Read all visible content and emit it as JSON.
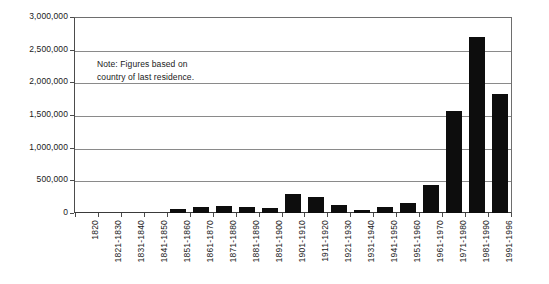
{
  "chart_data": {
    "type": "bar",
    "title": "",
    "xlabel": "",
    "ylabel": "",
    "categories": [
      "1820",
      "1821-1830",
      "1831-1840",
      "1841-1850",
      "1851-1860",
      "1861-1870",
      "1871-1880",
      "1881-1890",
      "1891-1900",
      "1901-1910",
      "1911-1920",
      "1921-1930",
      "1931-1940",
      "1941-1950",
      "1951-1960",
      "1961-1970",
      "1971-1980",
      "1981-1990",
      "1991-1996"
    ],
    "values": [
      0,
      0,
      0,
      0,
      60000,
      85000,
      105000,
      95000,
      80000,
      295000,
      240000,
      125000,
      40000,
      95000,
      150000,
      430000,
      1570000,
      2710000,
      1830000
    ],
    "ylim": [
      0,
      3000000
    ],
    "ytick_values": [
      0,
      500000,
      1000000,
      1500000,
      2000000,
      2500000,
      3000000
    ],
    "ytick_labels": [
      "0",
      "500,000",
      "1,000,000",
      "1,500,000",
      "2,000,000",
      "2,500,000",
      "3,000,000"
    ],
    "grid": true,
    "legend": "none",
    "bar_color": "#0d0d0d",
    "annotations": [
      {
        "name": "figures-note",
        "line1": "Note: Figures based on",
        "line2": "country of last residence."
      }
    ]
  }
}
